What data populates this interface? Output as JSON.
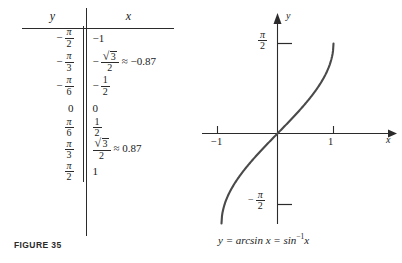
{
  "figure": {
    "label": "FIGURE 35"
  },
  "table": {
    "headers": {
      "y": "y",
      "x": "x"
    },
    "rows": [
      {
        "y": {
          "sign": "−",
          "num": "π",
          "den": "2"
        },
        "x": {
          "kind": "plain",
          "text": "−1"
        }
      },
      {
        "y": {
          "sign": "−",
          "num": "π",
          "den": "3"
        },
        "x": {
          "kind": "sqrt",
          "sign": "−",
          "num": "3",
          "den": "2",
          "approx": "≈ −0.87"
        }
      },
      {
        "y": {
          "sign": "−",
          "num": "π",
          "den": "6"
        },
        "x": {
          "kind": "frac",
          "sign": "−",
          "num": "1",
          "den": "2"
        }
      },
      {
        "y": {
          "sign": "",
          "num": "",
          "den": "",
          "plain": "0"
        },
        "x": {
          "kind": "plain",
          "text": "0"
        }
      },
      {
        "y": {
          "sign": "",
          "num": "π",
          "den": "6"
        },
        "x": {
          "kind": "frac",
          "sign": "",
          "num": "1",
          "den": "2"
        }
      },
      {
        "y": {
          "sign": "",
          "num": "π",
          "den": "3"
        },
        "x": {
          "kind": "sqrt",
          "sign": "",
          "num": "3",
          "den": "2",
          "approx": "≈ 0.87"
        }
      },
      {
        "y": {
          "sign": "",
          "num": "π",
          "den": "2"
        },
        "x": {
          "kind": "plain",
          "text": "1"
        }
      }
    ]
  },
  "graph": {
    "axis_label_y": "y",
    "axis_label_x": "x",
    "tick_x_negative_one": "−1",
    "tick_x_positive_one": "1",
    "tick_y_positive": {
      "sign": "",
      "num": "π",
      "den": "2"
    },
    "tick_y_negative": {
      "sign": "−",
      "num": "π",
      "den": "2"
    },
    "caption_part1": "y = arcsin x = sin",
    "caption_sup": "−1",
    "caption_part2": "x",
    "curve_color": "#4a4a4a",
    "axis_color": "#2b2b2b"
  },
  "chart_data": {
    "type": "line",
    "title": "",
    "xlabel": "x",
    "ylabel": "y",
    "xlim": [
      -1.15,
      1.35
    ],
    "ylim": [
      -2.05,
      2.05
    ],
    "xticks": [
      -1,
      1
    ],
    "xticklabels": [
      "−1",
      "1"
    ],
    "yticks": [
      1.5708,
      -1.5708
    ],
    "yticklabels": [
      "π/2",
      "−π/2"
    ],
    "grid": false,
    "legend": null,
    "series": [
      {
        "name": "y = arcsin x",
        "x": [
          -1.0,
          -0.95,
          -0.9,
          -0.8,
          -0.7,
          -0.6,
          -0.5,
          -0.4,
          -0.3,
          -0.2,
          -0.1,
          0.0,
          0.1,
          0.2,
          0.3,
          0.4,
          0.5,
          0.6,
          0.7,
          0.8,
          0.9,
          0.95,
          1.0
        ],
        "y": [
          -1.5708,
          -1.2532,
          -1.1198,
          -0.9273,
          -0.7754,
          -0.6435,
          -0.5236,
          -0.4115,
          -0.3047,
          -0.2014,
          -0.1002,
          0.0,
          0.1002,
          0.2014,
          0.3047,
          0.4115,
          0.5236,
          0.6435,
          0.7754,
          0.9273,
          1.1198,
          1.2532,
          1.5708
        ]
      }
    ],
    "table_points": {
      "columns": [
        "y",
        "x"
      ],
      "y_values": [
        "-π/2",
        "-π/3",
        "-π/6",
        "0",
        "π/6",
        "π/3",
        "π/2"
      ],
      "x_values": [
        "-1",
        "-√3/2 ≈ -0.87",
        "-1/2",
        "0",
        "1/2",
        "√3/2 ≈ 0.87",
        "1"
      ]
    }
  }
}
